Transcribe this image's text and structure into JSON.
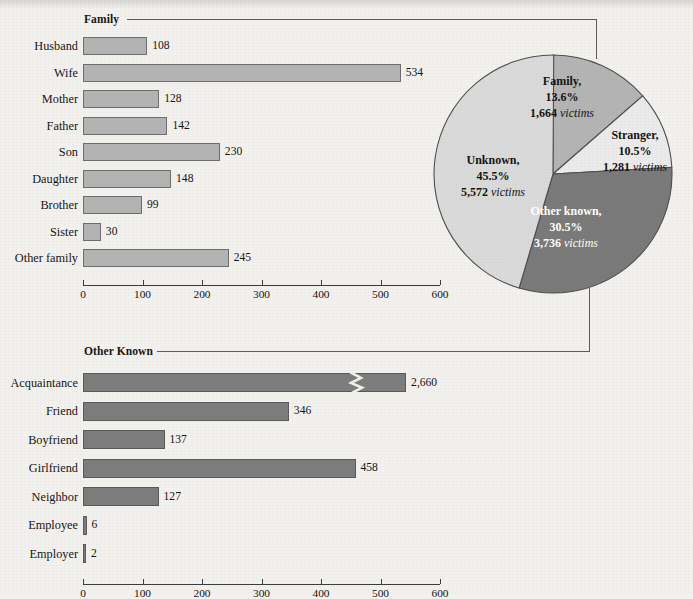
{
  "figure": {
    "background_color": "#f3f1ee",
    "sections": [
      {
        "key": "family",
        "label": "Family"
      },
      {
        "key": "other_known",
        "label": "Other Known"
      }
    ]
  },
  "chart_data": [
    {
      "id": "family-bar-chart",
      "type": "bar",
      "orientation": "horizontal",
      "title": "Family",
      "xlabel": "",
      "ylabel": "",
      "xlim": [
        0,
        600
      ],
      "xticks": [
        0,
        100,
        200,
        300,
        400,
        500,
        600
      ],
      "grid": false,
      "bar_color": "#b4b4b4",
      "bar_edge_color": "#6e6e6e",
      "categories": [
        "Husband",
        "Wife",
        "Mother",
        "Father",
        "Son",
        "Daughter",
        "Brother",
        "Sister",
        "Other family"
      ],
      "values": [
        108,
        534,
        128,
        142,
        230,
        148,
        99,
        30,
        245
      ],
      "value_labels": [
        "108",
        "534",
        "128",
        "142",
        "230",
        "148",
        "99",
        "30",
        "245"
      ]
    },
    {
      "id": "other-known-bar-chart",
      "type": "bar",
      "orientation": "horizontal",
      "title": "Other Known",
      "xlabel": "",
      "ylabel": "",
      "xlim": [
        0,
        600
      ],
      "xticks": [
        0,
        100,
        200,
        300,
        400,
        500,
        600
      ],
      "grid": false,
      "bar_color": "#7d7d7d",
      "bar_edge_color": "#5a5a5a",
      "categories": [
        "Acquaintance",
        "Friend",
        "Boyfriend",
        "Girlfriend",
        "Neighbor",
        "Employee",
        "Employer"
      ],
      "values": [
        2660,
        346,
        137,
        458,
        127,
        6,
        2
      ],
      "value_labels": [
        "2,660",
        "346",
        "137",
        "458",
        "127",
        "6",
        "2"
      ],
      "broken_axis_bars": [
        "Acquaintance"
      ],
      "broken_bar_note": "Acquaintance bar is drawn with an axis-break zigzag; true value 2,660 exceeds the 600 scale."
    },
    {
      "id": "relationship-pie-chart",
      "type": "pie",
      "title": "",
      "legend_position": "labels-on-slices",
      "slices": [
        {
          "label": "Family",
          "percent": 13.6,
          "victims": 1664,
          "victims_text": "1,664",
          "unit": "victims",
          "color": "#b4b4b4",
          "label_color": "#141414"
        },
        {
          "label": "Stranger",
          "percent": 10.5,
          "victims": 1281,
          "victims_text": "1,281",
          "unit": "victims",
          "color": "#ebebeb",
          "label_color": "#141414"
        },
        {
          "label": "Other known",
          "percent": 30.5,
          "victims": 3736,
          "victims_text": "3,736",
          "unit": "victims",
          "color": "#7a7a7a",
          "label_color": "#ffffff"
        },
        {
          "label": "Unknown",
          "percent": 45.5,
          "victims": 5572,
          "victims_text": "5,572",
          "unit": "victims",
          "color": "#dadada",
          "label_color": "#141414"
        }
      ]
    }
  ],
  "pie_labels": {
    "family": {
      "name": "Family,",
      "percent": "13.6%",
      "victims": "1,664",
      "unit": "victims"
    },
    "stranger": {
      "name": "Stranger,",
      "percent": "10.5%",
      "victims": "1,281",
      "unit": "victims"
    },
    "other_known": {
      "name": "Other known,",
      "percent": "30.5%",
      "victims": "3,736",
      "unit": "victims"
    },
    "unknown": {
      "name": "Unknown,",
      "percent": "45.5%",
      "victims": "5,572",
      "unit": "victims"
    }
  },
  "axis": {
    "tick_labels": [
      "0",
      "100",
      "200",
      "300",
      "400",
      "500",
      "600"
    ]
  }
}
